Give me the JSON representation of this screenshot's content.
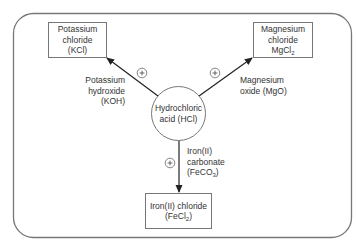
{
  "diagram": {
    "type": "reaction-network",
    "center_node": {
      "id": "hcl",
      "lines": [
        "Hydrochloric",
        "acid (HCl)"
      ]
    },
    "product_nodes": [
      {
        "id": "kcl",
        "lines": [
          "Potassium",
          "chloride",
          "(KCl)"
        ]
      },
      {
        "id": "mgcl2",
        "lines": [
          "Magnesium",
          "chloride"
        ],
        "formula_main": "MgCl",
        "formula_sub": "2"
      },
      {
        "id": "fecl2",
        "lines": [
          "Iron(II) chloride"
        ],
        "formula_prefix": "(FeCl",
        "formula_sub": "2",
        "formula_suffix": ")"
      }
    ],
    "edges": [
      {
        "from": "hcl",
        "to": "kcl",
        "reactant_lines": [
          "Potassium",
          "hydroxide",
          "(KOH)"
        ],
        "operator": "+"
      },
      {
        "from": "hcl",
        "to": "mgcl2",
        "reactant_lines": [
          "Magnesium",
          "oxide (MgO)"
        ],
        "operator": "+"
      },
      {
        "from": "hcl",
        "to": "fecl2",
        "reactant_lines": [
          "Iron(II)",
          "carbonate"
        ],
        "reactant_formula_prefix": "(FeCO",
        "reactant_formula_sub": "3",
        "reactant_formula_suffix": ")",
        "operator": "+"
      }
    ],
    "colors": {
      "frame": "#777777",
      "box_border": "#777777",
      "arrow": "#222222",
      "text": "#333333"
    }
  }
}
